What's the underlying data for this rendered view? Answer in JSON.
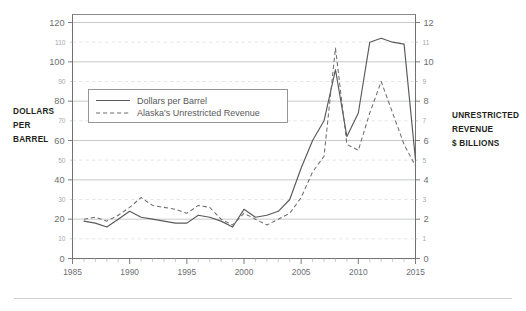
{
  "figure": {
    "left_axis_title": "DOLLARS\nPER\nBARREL",
    "left_axis_title_lines": [
      "DOLLARS",
      "PER",
      "BARREL"
    ],
    "right_axis_title_lines": [
      "UNRESTRICTED",
      "REVENUE",
      "$ BILLIONS"
    ],
    "colors": {
      "solid_series": "#595959",
      "dashed_series": "#6e6e6e",
      "grid_major": "#b9bbbd",
      "grid_minor": "#dcdde0",
      "frame": "#8c8c8c",
      "label_major": "#6d6e71",
      "label_minor": "#a7a9ac",
      "axis_title": "#231f20",
      "background": "#ffffff"
    }
  },
  "chart_data": {
    "type": "line",
    "title": "",
    "subtitle": "",
    "xlabel": "",
    "ylabel": "DOLLARS PER BARREL",
    "y2label": "UNRESTRICTED REVENUE $ BILLIONS",
    "grid": true,
    "legend_position": "upper-left-inside",
    "xlim": [
      1985,
      2015
    ],
    "ylim": [
      0,
      120
    ],
    "y2lim": [
      0,
      12
    ],
    "xticks": [
      1985,
      1990,
      1995,
      2000,
      2005,
      2010,
      2015
    ],
    "xticks_minor": [
      1986,
      1987,
      1988,
      1989,
      1991,
      1992,
      1993,
      1994,
      1996,
      1997,
      1998,
      1999,
      2001,
      2002,
      2003,
      2004,
      2006,
      2007,
      2008,
      2009,
      2011,
      2012,
      2013,
      2014
    ],
    "yticks_major": [
      0,
      20,
      40,
      60,
      80,
      100,
      120
    ],
    "yticks_minor": [
      10,
      30,
      50,
      70,
      90,
      110
    ],
    "y2ticks_major": [
      0,
      2,
      4,
      6,
      8,
      10,
      12
    ],
    "y2ticks_minor": [
      1,
      3,
      5,
      7,
      9,
      11
    ],
    "x": [
      1986,
      1987,
      1988,
      1989,
      1990,
      1991,
      1992,
      1993,
      1994,
      1995,
      1996,
      1997,
      1998,
      1999,
      2000,
      2001,
      2002,
      2003,
      2004,
      2005,
      2006,
      2007,
      2008,
      2009,
      2010,
      2011,
      2012,
      2013,
      2014,
      2015
    ],
    "series": [
      {
        "name": "Dollars per Barrel",
        "axis": "left",
        "style": "solid",
        "units": "$ per barrel",
        "values": [
          19,
          18,
          16,
          20,
          24,
          21,
          20,
          19,
          18,
          18,
          22,
          21,
          19,
          16,
          25,
          21,
          22,
          24,
          30,
          46,
          60,
          70,
          96,
          62,
          74,
          110,
          112,
          110,
          109,
          50
        ]
      },
      {
        "name": "Alaska's Unrestricted Revenue",
        "axis": "right",
        "style": "dashed",
        "units": "$ billions",
        "values": [
          2.0,
          2.1,
          1.9,
          2.2,
          2.6,
          3.1,
          2.7,
          2.6,
          2.5,
          2.3,
          2.7,
          2.6,
          2.0,
          1.7,
          2.3,
          2.0,
          1.7,
          2.0,
          2.3,
          3.1,
          4.4,
          5.2,
          10.7,
          5.8,
          5.5,
          7.4,
          9.0,
          7.4,
          5.8,
          4.7
        ]
      }
    ],
    "annotations": []
  },
  "legend": {
    "items": [
      {
        "label": "Dollars per Barrel",
        "style": "solid"
      },
      {
        "label": "Alaska's Unrestricted Revenue",
        "style": "dashed"
      }
    ]
  }
}
